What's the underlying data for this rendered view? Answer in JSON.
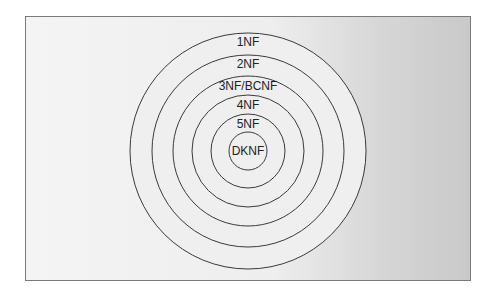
{
  "diagram": {
    "title": "",
    "type": "nested-circles",
    "rings": [
      {
        "label": "1NF",
        "radius": 118,
        "label_y": 42
      },
      {
        "label": "2NF",
        "radius": 96,
        "label_y": 64
      },
      {
        "label": "3NF/BCNF",
        "radius": 75,
        "label_y": 86
      },
      {
        "label": "4NF",
        "radius": 56,
        "label_y": 105
      },
      {
        "label": "5NF",
        "radius": 37,
        "label_y": 124
      },
      {
        "label": "DKNF",
        "radius": 19,
        "label_y": 154
      }
    ],
    "center": {
      "x": 248,
      "y": 151
    }
  }
}
